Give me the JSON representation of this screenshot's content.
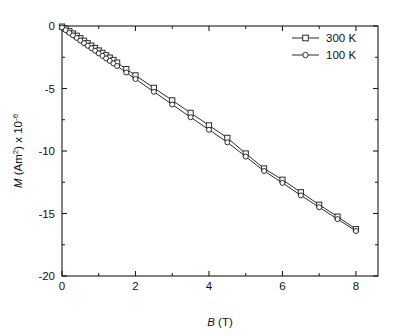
{
  "chart_data": {
    "type": "scatter",
    "title": "",
    "xlabel": "B (T)",
    "ylabel": "M (Am²) x 10⁻⁶",
    "ylabel_parts": {
      "symbol": "M",
      "unit_open": " (Am",
      "unit_sup": "2",
      "unit_close": ") x 10",
      "exponent": "-6"
    },
    "xlabel_parts": {
      "symbol": "B",
      "unit": " (T)"
    },
    "xlim": [
      0,
      8.6
    ],
    "ylim": [
      -20,
      0
    ],
    "xticks": [
      0,
      2,
      4,
      6,
      8
    ],
    "xtick_labels": [
      "0",
      "2",
      "4",
      "6",
      "8"
    ],
    "yticks": [
      0,
      -5,
      -10,
      -15,
      -20
    ],
    "ytick_labels": [
      "0",
      "-5",
      "-10",
      "-15",
      "-20"
    ],
    "x_minor_ticks": [
      1,
      3,
      5,
      7
    ],
    "y_minor_ticks": [
      -2.5,
      -7.5,
      -12.5,
      -17.5
    ],
    "grid": false,
    "legend_position": "upper-right",
    "series": [
      {
        "name": "300 K",
        "marker": "open-square",
        "color": "#2b2b2b",
        "x": [
          0.0,
          0.1,
          0.2,
          0.3,
          0.4,
          0.5,
          0.6,
          0.7,
          0.8,
          0.9,
          1.0,
          1.1,
          1.2,
          1.3,
          1.4,
          1.5,
          1.75,
          2.0,
          2.5,
          3.0,
          3.5,
          4.0,
          4.5,
          5.0,
          5.5,
          6.0,
          6.5,
          7.0,
          7.5,
          8.0
        ],
        "y": [
          -0.05,
          -0.22,
          -0.42,
          -0.6,
          -0.78,
          -0.98,
          -1.18,
          -1.38,
          -1.57,
          -1.76,
          -1.96,
          -2.15,
          -2.34,
          -2.53,
          -2.72,
          -2.93,
          -3.45,
          -3.95,
          -4.95,
          -5.95,
          -6.95,
          -7.95,
          -8.95,
          -10.2,
          -11.4,
          -12.3,
          -13.3,
          -14.3,
          -15.25,
          -16.25
        ]
      },
      {
        "name": "100 K",
        "marker": "open-circle",
        "color": "#2b2b2b",
        "x": [
          0.0,
          0.1,
          0.2,
          0.3,
          0.4,
          0.5,
          0.6,
          0.7,
          0.8,
          0.9,
          1.0,
          1.1,
          1.2,
          1.3,
          1.4,
          1.5,
          1.75,
          2.0,
          2.5,
          3.0,
          3.5,
          4.0,
          4.5,
          5.0,
          5.5,
          6.0,
          6.5,
          7.0,
          7.5,
          8.0
        ],
        "y": [
          -0.12,
          -0.33,
          -0.55,
          -0.75,
          -0.95,
          -1.16,
          -1.37,
          -1.58,
          -1.78,
          -1.98,
          -2.19,
          -2.39,
          -2.59,
          -2.79,
          -2.99,
          -3.2,
          -3.72,
          -4.24,
          -5.26,
          -6.28,
          -7.3,
          -8.3,
          -9.3,
          -10.45,
          -11.6,
          -12.55,
          -13.55,
          -14.5,
          -15.45,
          -16.4
        ]
      }
    ],
    "legend": [
      {
        "label": "300 K",
        "marker": "open-square"
      },
      {
        "label": "100 K",
        "marker": "open-circle"
      }
    ]
  }
}
